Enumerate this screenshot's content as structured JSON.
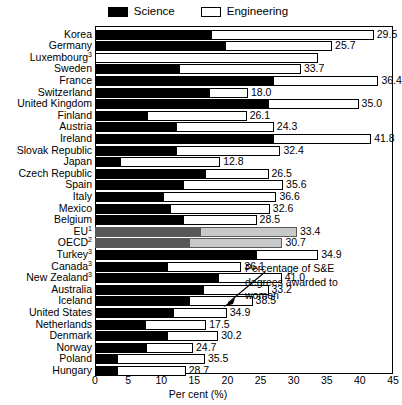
{
  "legend": {
    "items": [
      {
        "key": "science",
        "label": "Science",
        "color": "#000000"
      },
      {
        "key": "engineering",
        "label": "Engineering",
        "color": "#ffffff"
      }
    ]
  },
  "annotation": {
    "text": "Percentage of S&E degrees awarded to women",
    "line1": "Percentage of S&E",
    "line2": "degrees awarded to",
    "line3": "women"
  },
  "axis": {
    "xlabel": "Per cent (%)",
    "ticks": [
      "0",
      "5",
      "10",
      "15",
      "20",
      "25",
      "30",
      "35",
      "40",
      "45"
    ],
    "xlim": [
      0,
      45
    ]
  },
  "chart_data": {
    "type": "bar",
    "orientation": "horizontal",
    "stacked": true,
    "title": "",
    "xlabel": "Per cent (%)",
    "ylabel": "",
    "xlim": [
      0,
      45
    ],
    "xticks": [
      0,
      5,
      10,
      15,
      20,
      25,
      30,
      35,
      40,
      45
    ],
    "grid": false,
    "legend": [
      "Science",
      "Engineering"
    ],
    "legend_position": "top-center",
    "annotation": "Percentage of S&E degrees awarded to women",
    "value_label_note": "Labels at bar end give the total percentage of S&E degrees awarded to women",
    "categories": [
      "Korea",
      "Germany",
      "Luxembourg",
      "Sweden",
      "France",
      "Switzerland",
      "United Kingdom",
      "Finland",
      "Austria",
      "Ireland",
      "Slovak Republic",
      "Japan",
      "Czech Republic",
      "Spain",
      "Italy",
      "Mexico",
      "Belgium",
      "EU",
      "OECD",
      "Turkey",
      "Canada",
      "New Zealand",
      "Australia",
      "Iceland",
      "United States",
      "Netherlands",
      "Denmark",
      "Norway",
      "Poland",
      "Hungary"
    ],
    "category_footnotes": {
      "Luxembourg": "3",
      "EU": "1",
      "OECD": "2",
      "Turkey": "3",
      "Canada": "3",
      "New Zealand": "3"
    },
    "series": [
      {
        "name": "Science",
        "values": [
          17.6,
          19.8,
          0.0,
          12.9,
          27.0,
          17.3,
          26.3,
          8.0,
          12.4,
          27.0,
          12.4,
          4.0,
          16.8,
          13.4,
          10.4,
          11.5,
          13.4,
          16.0,
          14.4,
          24.4,
          11.0,
          18.7,
          16.4,
          14.3,
          11.9,
          7.7,
          11.0,
          7.9,
          3.4,
          3.4
        ]
      },
      {
        "name": "Engineering",
        "values": [
          24.5,
          16.0,
          33.6,
          18.2,
          15.8,
          5.8,
          13.5,
          14.9,
          14.6,
          14.7,
          15.6,
          14.9,
          9.4,
          15.0,
          17.0,
          14.9,
          11.0,
          14.5,
          13.9,
          9.3,
          11.1,
          9.5,
          9.8,
          9.5,
          8.0,
          9.1,
          7.6,
          6.9,
          13.2,
          10.3
        ]
      }
    ],
    "bar_totals": [
      42.1,
      35.8,
      33.6,
      31.1,
      42.8,
      23.1,
      39.8,
      22.9,
      27.0,
      41.7,
      28.0,
      18.9,
      26.2,
      28.4,
      27.4,
      26.4,
      24.4,
      30.5,
      28.3,
      33.7,
      22.1,
      28.2,
      26.2,
      23.8,
      19.9,
      16.8,
      18.6,
      14.8,
      16.6,
      13.7
    ],
    "value_labels": [
      "29.5",
      "25.7",
      "",
      "33.7",
      "36.4",
      "18.0",
      "35.0",
      "26.1",
      "24.3",
      "41.8",
      "32.4",
      "12.8",
      "26.5",
      "35.6",
      "36.6",
      "32.6",
      "28.5",
      "33.4",
      "30.7",
      "34.9",
      "36.1",
      "41.0",
      "33.2",
      "38.5",
      "34.9",
      "17.5",
      "30.2",
      "24.7",
      "35.5",
      "28.7"
    ],
    "values": [
      29.5,
      25.7,
      null,
      33.7,
      36.4,
      18.0,
      35.0,
      26.1,
      24.3,
      41.8,
      32.4,
      12.8,
      26.5,
      35.6,
      36.6,
      32.6,
      28.5,
      33.4,
      30.7,
      34.9,
      36.1,
      41.0,
      33.2,
      38.5,
      34.9,
      17.5,
      30.2,
      24.7,
      35.5,
      28.7
    ],
    "highlighted_rows": [
      "EU",
      "OECD"
    ],
    "highlight_style": "gray"
  }
}
